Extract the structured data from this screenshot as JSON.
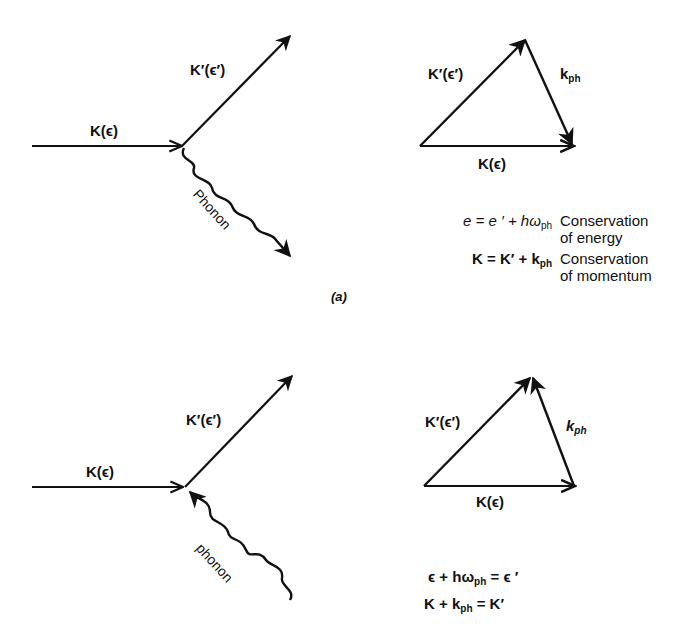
{
  "figure": {
    "panel_a": {
      "caption": "(a)",
      "feynman": {
        "incoming_label": "K(ϵ)",
        "outgoing_label": "K′(ϵ′)",
        "phonon_label": "Phonon",
        "phonon_direction": "emitted"
      },
      "vector_triangle": {
        "k_prime_label": "K′(ϵ′)",
        "k_ph_label": "k",
        "k_ph_sub": "ph",
        "k_label": "K(ϵ)"
      },
      "equations": [
        {
          "lhs": "e = e ′ + hω",
          "lhs_sub": "ph",
          "desc_line1": "Conservation",
          "desc_line2": "of energy"
        },
        {
          "lhs": "K = K′ + k",
          "lhs_sub": "ph",
          "desc_line1": "Conservation",
          "desc_line2": "of momentum"
        }
      ]
    },
    "panel_b": {
      "feynman": {
        "incoming_label": "K(ϵ)",
        "outgoing_label": "K′(ϵ′)",
        "phonon_label": "phonon",
        "phonon_direction": "absorbed"
      },
      "vector_triangle": {
        "k_prime_label": "K′(ϵ′)",
        "k_ph_label": "k",
        "k_ph_sub": "ph",
        "k_label": "K(ϵ)"
      },
      "equations": [
        {
          "lhs_a": "ϵ + hω",
          "lhs_sub": "ph",
          "rhs": " = ϵ ′"
        },
        {
          "lhs_a": "K + k",
          "lhs_sub": "ph",
          "rhs": " = K′"
        }
      ]
    }
  }
}
